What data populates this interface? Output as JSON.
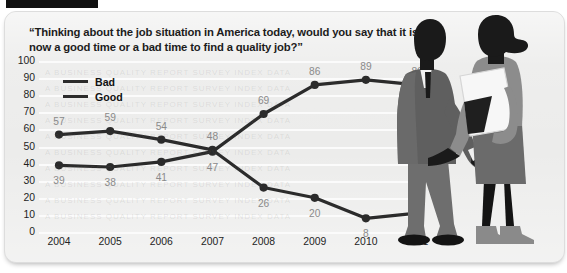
{
  "card": {
    "title": "“Thinking about the job situation in America today, would you say that it is now a good time or a bad time to find a quality job?”"
  },
  "illustration": {
    "name": "handshake-silhouette-illustration",
    "description": "Businessman and businesswoman silhouettes shaking hands",
    "suit_color": "#6e6e6e",
    "silhouette_color": "#1a1a1a",
    "dress_color": "#8a8a8a"
  },
  "chart_data": {
    "type": "line",
    "title": "“Thinking about the job situation in America today, would you say that it is now a good time or a bad time to find a quality job?”",
    "xlabel": "",
    "ylabel": "",
    "categories": [
      "2004",
      "2005",
      "2006",
      "2007",
      "2008",
      "2009",
      "2010",
      "2011"
    ],
    "x": [
      2004,
      2005,
      2006,
      2007,
      2008,
      2009,
      2010,
      2011
    ],
    "series": [
      {
        "name": "Bad",
        "values": [
          39,
          38,
          41,
          47,
          69,
          86,
          89,
          86
        ],
        "color": "#2b2b2b"
      },
      {
        "name": "Good",
        "values": [
          57,
          59,
          54,
          48,
          26,
          20,
          8,
          11
        ],
        "color": "#2b2b2b"
      }
    ],
    "ylim": [
      0,
      100
    ],
    "ytick_values": [
      100,
      90,
      80,
      70,
      60,
      50,
      40,
      30,
      20,
      10,
      0
    ],
    "ytick_labels": [
      "100",
      "90",
      "80",
      "70",
      "60",
      "50",
      "40",
      "30",
      "20",
      "10",
      "0"
    ],
    "grid": true,
    "grid_color": "#fbfbfb",
    "legend_position": "top-left",
    "legend": [
      "Bad",
      "Good"
    ],
    "background": "#ececeb",
    "label_color": "#8a8a8a",
    "data_labels": {
      "Bad": [
        "39",
        "38",
        "41",
        "47",
        "69",
        "86",
        "89",
        "86"
      ],
      "Good": [
        "57",
        "59",
        "54",
        "48",
        "26",
        "20",
        "8",
        "11"
      ]
    }
  }
}
